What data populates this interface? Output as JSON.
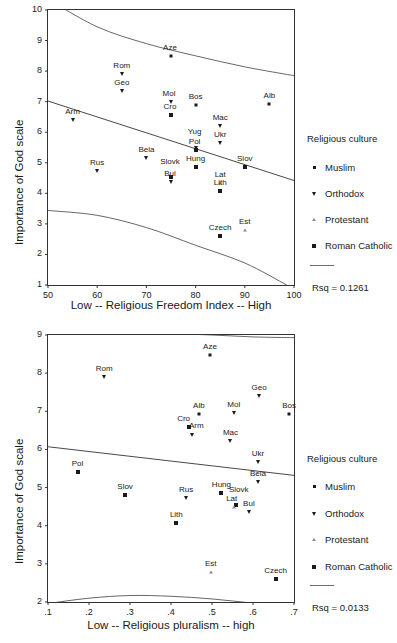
{
  "figure": {
    "background": "#ffffff",
    "ink_color": "#1a1a1a",
    "line_color": "#555555"
  },
  "legend": {
    "title": "Religious culture",
    "entries": [
      {
        "label": "Muslim",
        "marker": "small-square-marker"
      },
      {
        "label": "Orthodox",
        "marker": "triangle-down-marker"
      },
      {
        "label": "Protestant",
        "marker": "small-triangle-up-marker"
      },
      {
        "label": "Roman Catholic",
        "marker": "large-square-marker"
      }
    ],
    "fit_line_swatch": "regression-line-swatch"
  },
  "chart_data": [
    {
      "id": "religious-freedom-chart",
      "type": "scatter",
      "title": "",
      "xlabel": "Low -- Religious Freedom Index -- High",
      "ylabel": "Importance of God scale",
      "xlim": [
        50,
        100
      ],
      "ylim": [
        1,
        10
      ],
      "xticks": [
        "50",
        "60",
        "70",
        "80",
        "90",
        "100"
      ],
      "xtick_values": [
        50,
        60,
        70,
        80,
        90,
        100
      ],
      "yticks": [
        "1",
        "2",
        "3",
        "4",
        "5",
        "6",
        "7",
        "8",
        "9",
        "10"
      ],
      "ytick_values": [
        1,
        2,
        3,
        4,
        5,
        6,
        7,
        8,
        9,
        10
      ],
      "grid": false,
      "legend_position": "right",
      "annotation": "Rsq = 0.1261",
      "rsq": 0.1261,
      "points": [
        {
          "label": "Aze",
          "x": 75,
          "y": 8.5,
          "group": "Muslim",
          "marker": "small-square-marker",
          "label_dx": -1,
          "label_dy": -4
        },
        {
          "label": "Rom",
          "x": 65,
          "y": 7.92,
          "group": "Orthodox",
          "marker": "triangle-down-marker",
          "label_dx": 0,
          "label_dy": -4
        },
        {
          "label": "Geo",
          "x": 65,
          "y": 7.35,
          "group": "Orthodox",
          "marker": "triangle-down-marker",
          "label_dx": 0,
          "label_dy": -4
        },
        {
          "label": "Alb",
          "x": 95,
          "y": 6.92,
          "group": "Muslim",
          "marker": "small-square-marker",
          "label_dx": 0,
          "label_dy": -4
        },
        {
          "label": "Bos",
          "x": 80,
          "y": 6.9,
          "group": "Muslim",
          "marker": "small-square-marker",
          "label_dx": 0,
          "label_dy": -4
        },
        {
          "label": "Mol",
          "x": 75,
          "y": 7.0,
          "group": "Orthodox",
          "marker": "triangle-down-marker",
          "label_dx": -2,
          "label_dy": -4
        },
        {
          "label": "Cro",
          "x": 75,
          "y": 6.58,
          "group": "Roman Catholic",
          "marker": "large-square-marker",
          "label_dx": -1,
          "label_dy": -4
        },
        {
          "label": "Arm",
          "x": 55,
          "y": 6.4,
          "group": "Orthodox",
          "marker": "triangle-down-marker",
          "label_dx": 0,
          "label_dy": -4
        },
        {
          "label": "Mac",
          "x": 85,
          "y": 6.22,
          "group": "Orthodox",
          "marker": "triangle-down-marker",
          "label_dx": 0,
          "label_dy": -4
        },
        {
          "label": "Ukr",
          "x": 85,
          "y": 5.65,
          "group": "Orthodox",
          "marker": "triangle-down-marker",
          "label_dx": 0,
          "label_dy": -4
        },
        {
          "label": "Yug",
          "x": 80,
          "y": 5.48,
          "group": "Orthodox",
          "marker": "triangle-down-marker",
          "label_dx": -1,
          "label_dy": -12
        },
        {
          "label": "Pol",
          "x": 80,
          "y": 5.42,
          "group": "Roman Catholic",
          "marker": "large-square-marker",
          "label_dx": -1,
          "label_dy": -4
        },
        {
          "label": "Bela",
          "x": 70,
          "y": 5.15,
          "group": "Orthodox",
          "marker": "triangle-down-marker",
          "label_dx": 0,
          "label_dy": -4
        },
        {
          "label": "Hung",
          "x": 80,
          "y": 4.86,
          "group": "Roman Catholic",
          "marker": "large-square-marker",
          "label_dx": 0,
          "label_dy": -4
        },
        {
          "label": "Slov",
          "x": 90,
          "y": 4.87,
          "group": "Roman Catholic",
          "marker": "large-square-marker",
          "label_dx": 0,
          "label_dy": -4
        },
        {
          "label": "Rus",
          "x": 60,
          "y": 4.72,
          "group": "Orthodox",
          "marker": "triangle-down-marker",
          "label_dx": 0,
          "label_dy": -4
        },
        {
          "label": "Slovk",
          "x": 75,
          "y": 4.55,
          "group": "Roman Catholic",
          "marker": "large-square-marker",
          "label_dx": -1,
          "label_dy": -11
        },
        {
          "label": "Bul",
          "x": 75,
          "y": 4.38,
          "group": "Orthodox",
          "marker": "triangle-down-marker",
          "label_dx": -1,
          "label_dy": -4
        },
        {
          "label": "Lat",
          "x": 85,
          "y": 4.35,
          "group": "Protestant",
          "marker": "small-triangle-up-marker",
          "label_dx": 0,
          "label_dy": -4
        },
        {
          "label": "Lith",
          "x": 85,
          "y": 4.08,
          "group": "Roman Catholic",
          "marker": "large-square-marker",
          "label_dx": 0,
          "label_dy": -4
        },
        {
          "label": "Czech",
          "x": 85,
          "y": 2.61,
          "group": "Roman Catholic",
          "marker": "large-square-marker",
          "label_dx": 0,
          "label_dy": -4
        },
        {
          "label": "Est",
          "x": 90,
          "y": 2.8,
          "group": "Protestant",
          "marker": "small-triangle-up-marker",
          "label_dx": 0,
          "label_dy": -4
        }
      ],
      "fit_line": {
        "x0": 50,
        "y0": 7.02,
        "x1": 100,
        "y1": 4.42
      },
      "confidence_bands": {
        "upper": [
          [
            50,
            10.35
          ],
          [
            60,
            9.45
          ],
          [
            70,
            8.9
          ],
          [
            80,
            8.5
          ],
          [
            90,
            8.14
          ],
          [
            100,
            7.85
          ]
        ],
        "lower": [
          [
            50,
            3.44
          ],
          [
            60,
            3.28
          ],
          [
            70,
            2.88
          ],
          [
            80,
            2.3
          ],
          [
            90,
            1.72
          ],
          [
            98.5,
            1.0
          ]
        ]
      }
    },
    {
      "id": "religious-pluralism-chart",
      "type": "scatter",
      "title": "",
      "xlabel": "Low -- Religious pluralism -- high",
      "ylabel": "Importance of God scale",
      "xlim": [
        0.1,
        0.7
      ],
      "ylim": [
        2,
        9
      ],
      "xticks": [
        ".1",
        ".2",
        ".3",
        ".4",
        ".5",
        ".6",
        ".7"
      ],
      "xtick_values": [
        0.1,
        0.2,
        0.3,
        0.4,
        0.5,
        0.6,
        0.7
      ],
      "yticks": [
        "2",
        "3",
        "4",
        "5",
        "6",
        "7",
        "8",
        "9"
      ],
      "ytick_values": [
        2,
        3,
        4,
        5,
        6,
        7,
        8,
        9
      ],
      "grid": false,
      "legend_position": "right",
      "annotation": "Rsq = 0.0133",
      "rsq": 0.0133,
      "points": [
        {
          "label": "Aze",
          "x": 0.495,
          "y": 8.47,
          "group": "Muslim",
          "marker": "small-square-marker",
          "label_dx": 0,
          "label_dy": -4
        },
        {
          "label": "Rom",
          "x": 0.237,
          "y": 7.9,
          "group": "Orthodox",
          "marker": "triangle-down-marker",
          "label_dx": 0,
          "label_dy": -4
        },
        {
          "label": "Geo",
          "x": 0.615,
          "y": 7.4,
          "group": "Orthodox",
          "marker": "triangle-down-marker",
          "label_dx": 0,
          "label_dy": -4
        },
        {
          "label": "Alb",
          "x": 0.468,
          "y": 6.93,
          "group": "Muslim",
          "marker": "small-square-marker",
          "label_dx": 0,
          "label_dy": -4
        },
        {
          "label": "Mol",
          "x": 0.553,
          "y": 6.95,
          "group": "Orthodox",
          "marker": "triangle-down-marker",
          "label_dx": 0,
          "label_dy": -4
        },
        {
          "label": "Bos",
          "x": 0.688,
          "y": 6.92,
          "group": "Muslim",
          "marker": "small-square-marker",
          "label_dx": 0,
          "label_dy": -4
        },
        {
          "label": "Cro",
          "x": 0.443,
          "y": 6.58,
          "group": "Roman Catholic",
          "marker": "large-square-marker",
          "label_dx": -5,
          "label_dy": -4
        },
        {
          "label": "Arm",
          "x": 0.452,
          "y": 6.38,
          "group": "Orthodox",
          "marker": "triangle-down-marker",
          "label_dx": 4,
          "label_dy": -5
        },
        {
          "label": "Mac",
          "x": 0.545,
          "y": 6.22,
          "group": "Orthodox",
          "marker": "triangle-down-marker",
          "label_dx": 0,
          "label_dy": -4
        },
        {
          "label": "Ukr",
          "x": 0.612,
          "y": 5.67,
          "group": "Orthodox",
          "marker": "triangle-down-marker",
          "label_dx": 0,
          "label_dy": -4
        },
        {
          "label": "Pol",
          "x": 0.172,
          "y": 5.4,
          "group": "Roman Catholic",
          "marker": "large-square-marker",
          "label_dx": 0,
          "label_dy": -4
        },
        {
          "label": "Bela",
          "x": 0.612,
          "y": 5.14,
          "group": "Orthodox",
          "marker": "triangle-down-marker",
          "label_dx": 0,
          "label_dy": -4
        },
        {
          "label": "Hung",
          "x": 0.523,
          "y": 4.86,
          "group": "Roman Catholic",
          "marker": "large-square-marker",
          "label_dx": 0,
          "label_dy": -4
        },
        {
          "label": "Slov",
          "x": 0.288,
          "y": 4.8,
          "group": "Roman Catholic",
          "marker": "large-square-marker",
          "label_dx": 0,
          "label_dy": -4
        },
        {
          "label": "Rus",
          "x": 0.437,
          "y": 4.73,
          "group": "Orthodox",
          "marker": "triangle-down-marker",
          "label_dx": 0,
          "label_dy": -4
        },
        {
          "label": "Slovk",
          "x": 0.558,
          "y": 4.55,
          "group": "Roman Catholic",
          "marker": "large-square-marker",
          "label_dx": 3,
          "label_dy": -11
        },
        {
          "label": "Lat",
          "x": 0.553,
          "y": 4.48,
          "group": "Protestant",
          "marker": "small-triangle-up-marker",
          "label_dx": -2,
          "label_dy": -4
        },
        {
          "label": "Bul",
          "x": 0.59,
          "y": 4.36,
          "group": "Orthodox",
          "marker": "triangle-down-marker",
          "label_dx": 0,
          "label_dy": -4
        },
        {
          "label": "Lith",
          "x": 0.413,
          "y": 4.08,
          "group": "Roman Catholic",
          "marker": "large-square-marker",
          "label_dx": 0,
          "label_dy": -4
        },
        {
          "label": "Est",
          "x": 0.497,
          "y": 2.78,
          "group": "Protestant",
          "marker": "small-triangle-up-marker",
          "label_dx": 0,
          "label_dy": -4
        },
        {
          "label": "Czech",
          "x": 0.655,
          "y": 2.6,
          "group": "Roman Catholic",
          "marker": "large-square-marker",
          "label_dx": 0,
          "label_dy": -4
        }
      ],
      "fit_line": {
        "x0": 0.1,
        "y0": 6.07,
        "x1": 0.7,
        "y1": 5.32
      },
      "confidence_bands": {
        "upper": [
          [
            0.1,
            9.02
          ],
          [
            0.25,
            9.03
          ],
          [
            0.4,
            9.03
          ],
          [
            0.5,
            9.0
          ],
          [
            0.6,
            8.95
          ],
          [
            0.7,
            8.93
          ]
        ],
        "lower": [
          [
            0.1,
            1.96
          ],
          [
            0.2,
            2.1
          ],
          [
            0.3,
            2.17
          ],
          [
            0.4,
            2.15
          ],
          [
            0.5,
            2.08
          ],
          [
            0.6,
            1.97
          ],
          [
            0.7,
            1.88
          ]
        ]
      }
    }
  ]
}
